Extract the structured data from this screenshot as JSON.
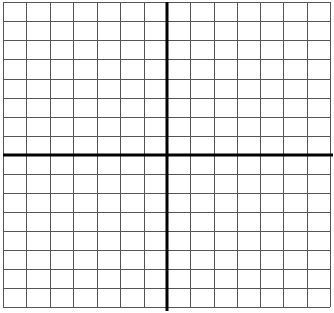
{
  "diagram": {
    "type": "coordinate-grid",
    "columns_left_of_y_axis": 7,
    "columns_right_of_y_axis": 7,
    "rows_above_x_axis": 8,
    "rows_below_x_axis": 8,
    "grid_left": 3,
    "grid_right": 330,
    "grid_top": 2,
    "grid_bottom": 307,
    "axis_x_px": 167,
    "axis_y_px": 155,
    "colors": {
      "background": "#ffffff",
      "grid_line": "#555555",
      "axis_line": "#000000"
    }
  }
}
